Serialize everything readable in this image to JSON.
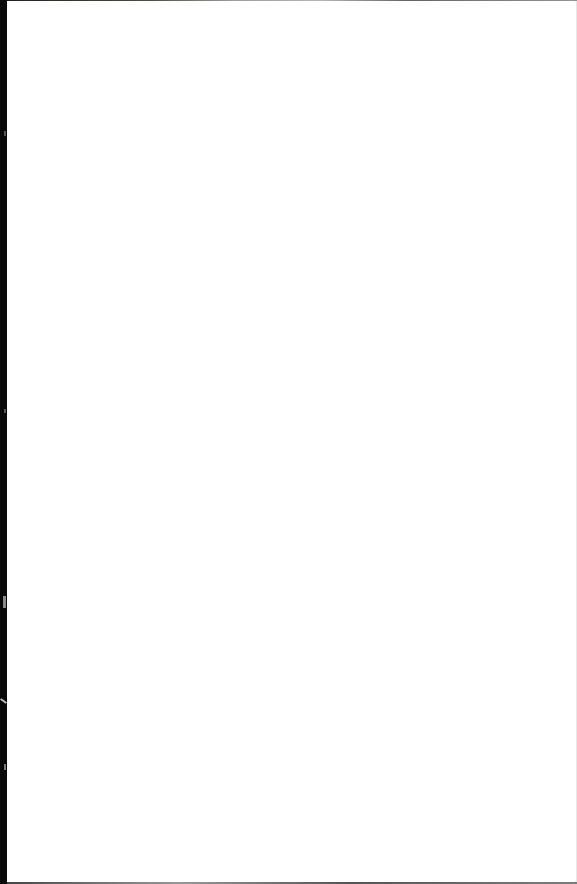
{
  "document": {
    "type": "blank-scanned-page",
    "text": "",
    "colors": {
      "page": "#ffffff",
      "background": "#0a0a0a"
    }
  }
}
